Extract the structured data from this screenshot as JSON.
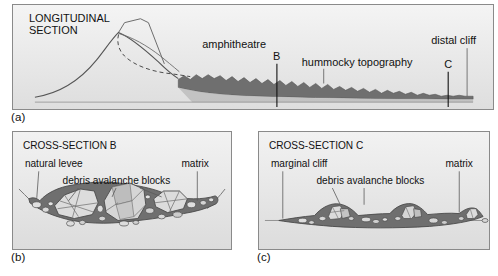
{
  "figure": {
    "panels": [
      {
        "id": "a",
        "fig_label": "(a)",
        "title": "LONGITUDINAL\nSECTION",
        "title_line1": "LONGITUDINAL",
        "title_line2": "SECTION",
        "labels": {
          "amphitheatre": "amphitheatre",
          "hummocky": "hummocky topography",
          "distal_cliff": "distal cliff",
          "marker_b": "B",
          "marker_c": "C"
        }
      },
      {
        "id": "b",
        "fig_label": "(b)",
        "title": "CROSS-SECTION B",
        "labels": {
          "natural_levee": "natural levee",
          "matrix": "matrix",
          "blocks": "debris avalanche blocks"
        }
      },
      {
        "id": "c",
        "fig_label": "(c)",
        "title": "CROSS-SECTION C",
        "labels": {
          "marginal_cliff": "marginal cliff",
          "matrix": "matrix",
          "blocks": "debris avalanche blocks"
        }
      }
    ]
  },
  "colors": {
    "panel_background_top": "#f2f2f2",
    "panel_background_bottom": "#dcdcdc",
    "volcano_fill": "#e8e8e8",
    "deposit_dark": "#6e6e6e",
    "deposit_mid": "#8c8c8c",
    "block_light": "#e2e2e2",
    "block_mid": "#c0c0c0",
    "outline": "#3a3a3a",
    "border": "#8a8a8a",
    "text": "#111111"
  }
}
